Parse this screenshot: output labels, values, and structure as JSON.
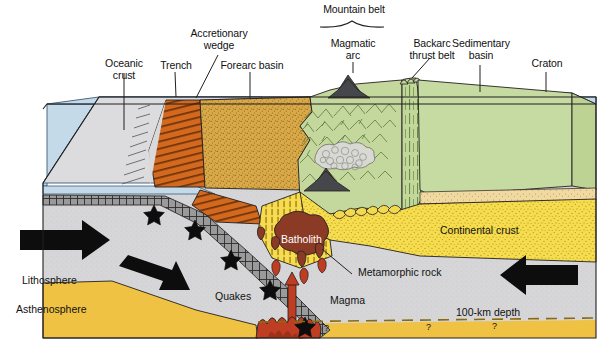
{
  "figure": {
    "brace_label": "Mountain belt"
  },
  "surface_labels": [
    {
      "id": "oceanic-crust",
      "text": "Oceanic\ncrust"
    },
    {
      "id": "trench",
      "text": "Trench"
    },
    {
      "id": "accretionary-wedge",
      "text": "Accretionary\nwedge"
    },
    {
      "id": "forearc-basin",
      "text": "Forearc basin"
    },
    {
      "id": "magmatic-arc",
      "text": "Magmatic\narc"
    },
    {
      "id": "backarc-thrust-belt",
      "text": "Backarc\nthrust belt"
    },
    {
      "id": "sedimentary-basin",
      "text": "Sedimentary\nbasin"
    },
    {
      "id": "craton",
      "text": "Craton"
    }
  ],
  "interior_labels": [
    {
      "id": "lithosphere",
      "text": "Lithosphere"
    },
    {
      "id": "asthenosphere",
      "text": "Asthenosphere"
    },
    {
      "id": "quakes",
      "text": "Quakes"
    },
    {
      "id": "batholith",
      "text": "Batholith"
    },
    {
      "id": "magma",
      "text": "Magma"
    },
    {
      "id": "metamorphic-rock",
      "text": "Metamorphic rock"
    },
    {
      "id": "continental-crust",
      "text": "Continental  crust"
    },
    {
      "id": "depth-marker",
      "text": "100-km depth"
    }
  ],
  "uncertainty_marks": [
    {
      "id": "question-1",
      "text": "?"
    },
    {
      "id": "question-2",
      "text": "?"
    },
    {
      "id": "question-3",
      "text": "?"
    }
  ],
  "colors": {
    "ocean_water": "#c5dae8",
    "oceanic_lithosphere": "#d6d6d8",
    "slab_crust": "#9a9a9a",
    "accretionary_wedge": "#d2691e",
    "forearc_basin": "#d9a948",
    "craton_green": "#c6dba2",
    "arc_green": "#bdd293",
    "continental_crust": "#f6dc4f",
    "sedimentary_cover": "#f0d9a0",
    "asthenosphere": "#efc244",
    "batholith": "#8b3a26",
    "magma": "#bf3d22",
    "volcano": "#46474a",
    "outline": "#231f20"
  }
}
